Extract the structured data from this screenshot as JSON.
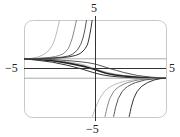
{
  "chart_data": {
    "type": "line",
    "title": "",
    "xlabel": "",
    "ylabel": "",
    "xlim": [
      -5,
      5
    ],
    "ylim": [
      -5,
      5
    ],
    "grid": false,
    "legend": null,
    "tick_labels": {
      "x_left": "−5",
      "x_right": "5",
      "y_top": "5",
      "y_bottom": "−5"
    },
    "asymptotes": [
      {
        "type": "horizontal",
        "y": 1,
        "description": "left-end limit of curves"
      },
      {
        "type": "horizontal",
        "y": -1,
        "description": "right-end limit of curves"
      }
    ],
    "series": [
      {
        "name": "blowup-up-1",
        "description": "rises from y=1 at left, blows up near x=-2.5",
        "points": [
          [
            -5,
            1
          ],
          [
            -4,
            1.1
          ],
          [
            -3.2,
            1.8
          ],
          [
            -2.8,
            3
          ],
          [
            -2.5,
            5
          ]
        ]
      },
      {
        "name": "blowup-up-2",
        "description": "rises from y=1, blows up near x=-1.3",
        "points": [
          [
            -5,
            1
          ],
          [
            -3,
            1.1
          ],
          [
            -2,
            1.6
          ],
          [
            -1.6,
            3
          ],
          [
            -1.3,
            5
          ]
        ]
      },
      {
        "name": "blowup-up-3",
        "description": "rises from y=1, blows up near x=-0.6",
        "points": [
          [
            -5,
            1
          ],
          [
            -2,
            1.1
          ],
          [
            -1.2,
            1.8
          ],
          [
            -0.8,
            3.2
          ],
          [
            -0.6,
            5
          ]
        ]
      },
      {
        "name": "blowup-up-4",
        "description": "rises from y=1, blows up near x=-0.2",
        "points": [
          [
            -5,
            1
          ],
          [
            -1.5,
            1.1
          ],
          [
            -0.6,
            2
          ],
          [
            -0.35,
            3.5
          ],
          [
            -0.2,
            5
          ]
        ]
      },
      {
        "name": "transition-1",
        "description": "decreasing from 1 to -1",
        "points": [
          [
            -5,
            1
          ],
          [
            -3,
            0.9
          ],
          [
            -1,
            0.5
          ],
          [
            0,
            0
          ],
          [
            1,
            -0.5
          ],
          [
            3,
            -0.9
          ],
          [
            5,
            -1
          ]
        ]
      },
      {
        "name": "transition-2",
        "description": "decreasing from 1 to -1, bold",
        "points": [
          [
            -5,
            1
          ],
          [
            -3,
            0.85
          ],
          [
            -1,
            0.3
          ],
          [
            0,
            -0.1
          ],
          [
            1,
            -0.6
          ],
          [
            3,
            -0.95
          ],
          [
            5,
            -1
          ]
        ]
      },
      {
        "name": "transition-3",
        "description": "decreasing from 1 to -1",
        "points": [
          [
            -5,
            1
          ],
          [
            -3,
            0.95
          ],
          [
            -1,
            0.7
          ],
          [
            0,
            0.5
          ],
          [
            1,
            0
          ],
          [
            3,
            -0.8
          ],
          [
            5,
            -1
          ]
        ]
      },
      {
        "name": "transition-4",
        "description": "decreasing from 1 to -1",
        "points": [
          [
            -5,
            1
          ],
          [
            -3,
            0.7
          ],
          [
            -1,
            0
          ],
          [
            0,
            -0.5
          ],
          [
            1,
            -0.8
          ],
          [
            3,
            -1
          ],
          [
            5,
            -1
          ]
        ]
      },
      {
        "name": "blowup-down-1",
        "description": "from -5 near x=-0.2, rising to -1 at right",
        "points": [
          [
            -0.2,
            -5
          ],
          [
            0.3,
            -3
          ],
          [
            1,
            -1.8
          ],
          [
            2.5,
            -1.1
          ],
          [
            5,
            -1
          ]
        ]
      },
      {
        "name": "blowup-down-2",
        "description": "from -5 near x=0.7",
        "points": [
          [
            0.7,
            -5
          ],
          [
            1,
            -3
          ],
          [
            1.6,
            -1.8
          ],
          [
            3,
            -1.1
          ],
          [
            5,
            -1
          ]
        ]
      },
      {
        "name": "blowup-down-3",
        "description": "from -5 near x=1.3",
        "points": [
          [
            1.3,
            -5
          ],
          [
            1.6,
            -3
          ],
          [
            2.2,
            -1.8
          ],
          [
            3.5,
            -1.1
          ],
          [
            5,
            -1
          ]
        ]
      },
      {
        "name": "blowup-down-4",
        "description": "from -5 near x=2.4",
        "points": [
          [
            2.4,
            -5
          ],
          [
            2.7,
            -3
          ],
          [
            3.2,
            -1.8
          ],
          [
            4.2,
            -1.1
          ],
          [
            5,
            -1
          ]
        ]
      }
    ]
  }
}
